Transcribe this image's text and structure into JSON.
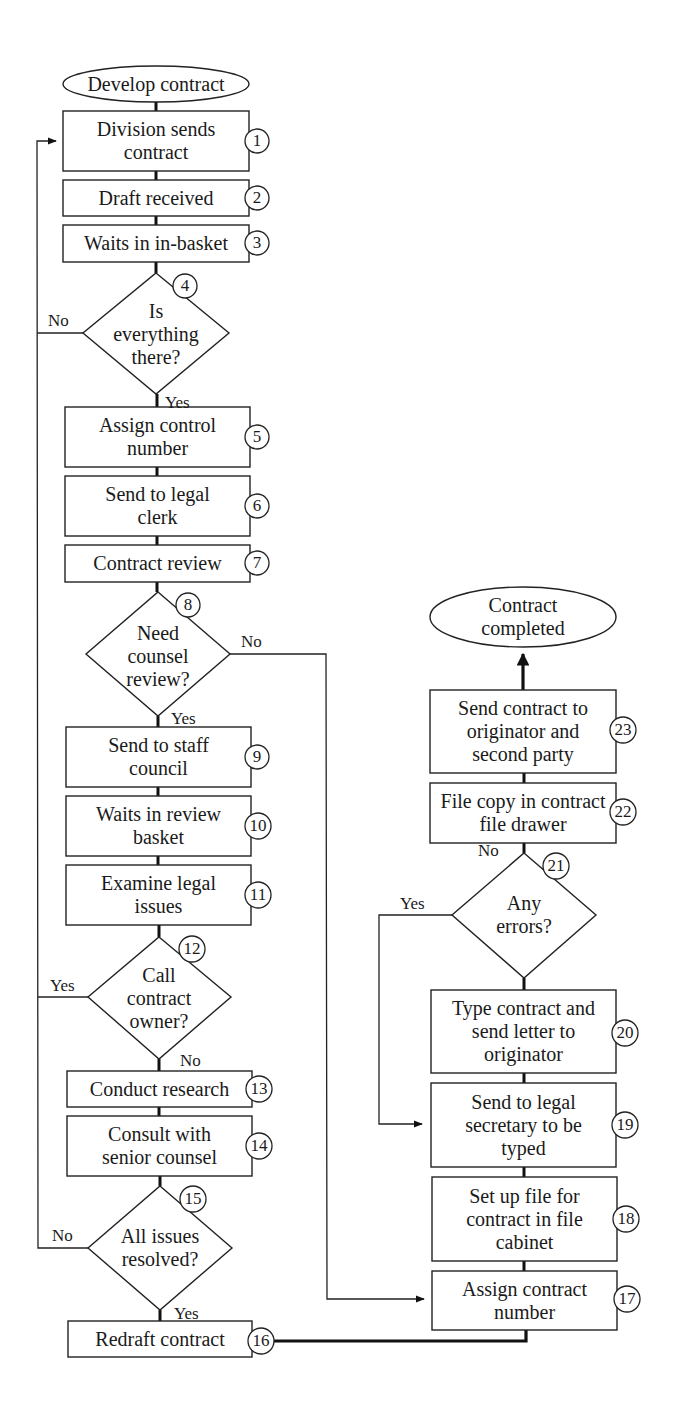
{
  "diagram": {
    "type": "flowchart",
    "start": {
      "label": "Develop contract"
    },
    "end": {
      "label": "Contract completed"
    },
    "steps": [
      {
        "id": 1,
        "kind": "process",
        "label": "Division sends contract",
        "lines": [
          "Division sends",
          "contract"
        ]
      },
      {
        "id": 2,
        "kind": "process",
        "label": "Draft received",
        "lines": [
          "Draft received"
        ]
      },
      {
        "id": 3,
        "kind": "process",
        "label": "Waits in in-basket",
        "lines": [
          "Waits in in-basket"
        ]
      },
      {
        "id": 4,
        "kind": "decision",
        "label": "Is everything there?",
        "lines": [
          "Is",
          "everything",
          "there?"
        ],
        "yes": 5,
        "no": 1
      },
      {
        "id": 5,
        "kind": "process",
        "label": "Assign control number",
        "lines": [
          "Assign control",
          "number"
        ]
      },
      {
        "id": 6,
        "kind": "process",
        "label": "Send to legal clerk",
        "lines": [
          "Send to legal",
          "clerk"
        ]
      },
      {
        "id": 7,
        "kind": "process",
        "label": "Contract review",
        "lines": [
          "Contract review"
        ]
      },
      {
        "id": 8,
        "kind": "decision",
        "label": "Need counsel review?",
        "lines": [
          "Need",
          "counsel",
          "review?"
        ],
        "yes": 9,
        "no": 17
      },
      {
        "id": 9,
        "kind": "process",
        "label": "Send to staff council",
        "lines": [
          "Send to staff",
          "council"
        ]
      },
      {
        "id": 10,
        "kind": "process",
        "label": "Waits in review basket",
        "lines": [
          "Waits in review",
          "basket"
        ]
      },
      {
        "id": 11,
        "kind": "process",
        "label": "Examine legal issues",
        "lines": [
          "Examine legal",
          "issues"
        ]
      },
      {
        "id": 12,
        "kind": "decision",
        "label": "Call contract owner?",
        "lines": [
          "Call",
          "contract",
          "owner?"
        ],
        "yes": 1,
        "no": 13
      },
      {
        "id": 13,
        "kind": "process",
        "label": "Conduct research",
        "lines": [
          "Conduct research"
        ]
      },
      {
        "id": 14,
        "kind": "process",
        "label": "Consult with senior counsel",
        "lines": [
          "Consult with",
          "senior counsel"
        ]
      },
      {
        "id": 15,
        "kind": "decision",
        "label": "All issues resolved?",
        "lines": [
          "All",
          "issues",
          "resolved?"
        ],
        "yes": 16,
        "no": 1
      },
      {
        "id": 16,
        "kind": "process",
        "label": "Redraft contract",
        "lines": [
          "Redraft contract"
        ]
      },
      {
        "id": 17,
        "kind": "process",
        "label": "Assign contract number",
        "lines": [
          "Assign contract",
          "number"
        ]
      },
      {
        "id": 18,
        "kind": "process",
        "label": "Set up file for contract in file cabinet",
        "lines": [
          "Set up file for",
          "contract in file",
          "cabinet"
        ]
      },
      {
        "id": 19,
        "kind": "process",
        "label": "Send to legal secretary to be typed",
        "lines": [
          "Send to legal",
          "secretary to",
          "be typed"
        ]
      },
      {
        "id": 20,
        "kind": "process",
        "label": "Type contract and send letter to originator",
        "lines": [
          "Type contract",
          "and send letter to",
          "originator"
        ]
      },
      {
        "id": 21,
        "kind": "decision",
        "label": "Any errors?",
        "lines": [
          "Any",
          "errors?"
        ],
        "yes": 19,
        "no": 22
      },
      {
        "id": 22,
        "kind": "process",
        "label": "File copy in contract file drawer",
        "lines": [
          "File copy in con-",
          "tract file drawer"
        ]
      },
      {
        "id": 23,
        "kind": "process",
        "label": "Send contract to originator and second party",
        "lines": [
          "Send contract to",
          "originator and",
          "second party"
        ]
      }
    ],
    "edge_labels": {
      "yes": "Yes",
      "no": "No"
    },
    "colors": {
      "stroke": "#222222",
      "fill": "#ffffff",
      "text": "#1a1a1a"
    }
  }
}
